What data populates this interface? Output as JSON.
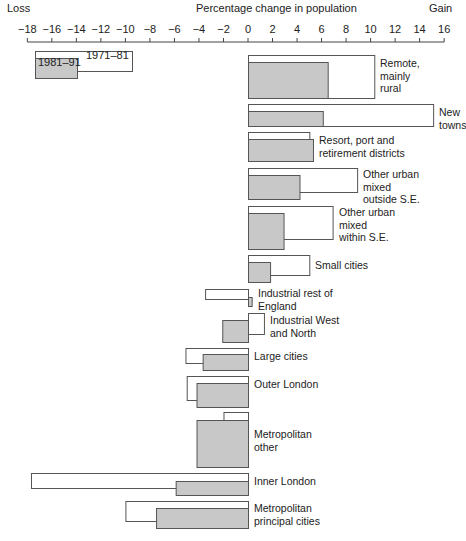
{
  "chart_data": {
    "type": "bar",
    "orientation": "horizontal",
    "title": "Percentage change in population",
    "xlabel_left": "Loss",
    "xlabel_right": "Gain",
    "xlim": [
      -18,
      16
    ],
    "xticks": [
      -18,
      -16,
      -14,
      -12,
      -10,
      -8,
      -6,
      -4,
      -2,
      0,
      2,
      4,
      6,
      8,
      10,
      12,
      14,
      16
    ],
    "legend": [
      {
        "name": "1971–81",
        "style": "white fill, outline"
      },
      {
        "name": "1981–91",
        "style": "grey fill, outline"
      }
    ],
    "categories": [
      "Remote, mainly rural",
      "New towns",
      "Resort, port and retirement districts",
      "Other urban mixed outside S.E.",
      "Other urban mixed within S.E.",
      "Small cities",
      "Industrial rest of England",
      "Industrial West and North",
      "Large cities",
      "Outer London",
      "Metropolitan other",
      "Inner London",
      "Metropolitan principal cities"
    ],
    "series": [
      {
        "name": "1971–81",
        "values": [
          10.3,
          15.1,
          5.0,
          8.9,
          6.9,
          5.0,
          -3.5,
          1.3,
          -5.1,
          -5.0,
          -2.0,
          -17.7,
          -10.0
        ]
      },
      {
        "name": "1981–91",
        "values": [
          6.5,
          6.1,
          5.3,
          4.2,
          2.9,
          1.8,
          0.3,
          -2.1,
          -3.7,
          -4.2,
          -4.2,
          -5.9,
          -7.5
        ]
      }
    ],
    "grid": false,
    "legend_position": "upper left"
  },
  "labels": {
    "loss": "Loss",
    "gain": "Gain",
    "title": "Percentage change in population",
    "legend_1971": "1971–81",
    "legend_1981": "1981–91"
  },
  "rows": [
    {
      "lines": [
        "Remote,",
        "mainly",
        "rural"
      ]
    },
    {
      "lines": [
        "New towns"
      ]
    },
    {
      "lines": [
        "Resort, port and",
        "retirement districts"
      ]
    },
    {
      "lines": [
        "Other urban",
        "mixed",
        "outside S.E."
      ]
    },
    {
      "lines": [
        "Other urban",
        "mixed",
        "within S.E."
      ]
    },
    {
      "lines": [
        "Small cities"
      ]
    },
    {
      "lines": [
        "Industrial rest of",
        "England"
      ]
    },
    {
      "lines": [
        "Industrial West",
        "and North"
      ]
    },
    {
      "lines": [
        "Large cities"
      ]
    },
    {
      "lines": [
        "Outer London"
      ]
    },
    {
      "lines": [
        "Metropolitan",
        "other"
      ]
    },
    {
      "lines": [
        "Inner London"
      ]
    },
    {
      "lines": [
        "Metropolitan",
        "principal cities"
      ]
    }
  ],
  "colors": {
    "grey_bar": "#c8c8c8",
    "white_bar": "#ffffff",
    "stroke": "#555555"
  }
}
